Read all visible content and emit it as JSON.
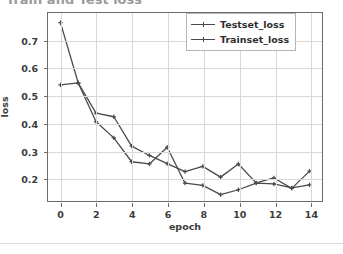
{
  "page": {
    "cut_off_heading": "Train and Test loss"
  },
  "chart_data": {
    "type": "line",
    "title": "",
    "xlabel": "epoch",
    "ylabel": "loss",
    "x": [
      0,
      1,
      2,
      3,
      4,
      5,
      6,
      7,
      8,
      9,
      10,
      11,
      12,
      13,
      14
    ],
    "xlim": [
      -0.7,
      14.7
    ],
    "ylim": [
      0.115,
      0.8
    ],
    "xticks": [
      0,
      2,
      4,
      6,
      8,
      10,
      12,
      14
    ],
    "xticklabels": [
      "0",
      "2",
      "4",
      "6",
      "8",
      "10",
      "12",
      "14"
    ],
    "yticks": [
      0.2,
      0.3,
      0.4,
      0.5,
      0.6,
      0.7
    ],
    "yticklabels": [
      "0.2",
      "0.3",
      "0.4",
      "0.5",
      "0.6",
      "0.7"
    ],
    "grid": true,
    "legend_position": "upper right",
    "series": [
      {
        "name": "Testset_loss",
        "color": "#4a4a4a",
        "marker": "plus",
        "values": [
          0.765,
          0.545,
          0.435,
          0.422,
          0.315,
          0.281,
          0.251,
          0.222,
          0.241,
          0.202,
          0.25,
          0.181,
          0.199,
          0.161,
          0.224
        ]
      },
      {
        "name": "Trainset_loss",
        "color": "#4a4a4a",
        "marker": "plus",
        "values": [
          0.538,
          0.545,
          0.404,
          0.345,
          0.258,
          0.25,
          0.311,
          0.18,
          0.172,
          0.138,
          0.156,
          0.18,
          0.177,
          0.163,
          0.174
        ]
      }
    ]
  },
  "legend": {
    "items": [
      {
        "label": "Testset_loss"
      },
      {
        "label": "Trainset_loss"
      }
    ]
  }
}
